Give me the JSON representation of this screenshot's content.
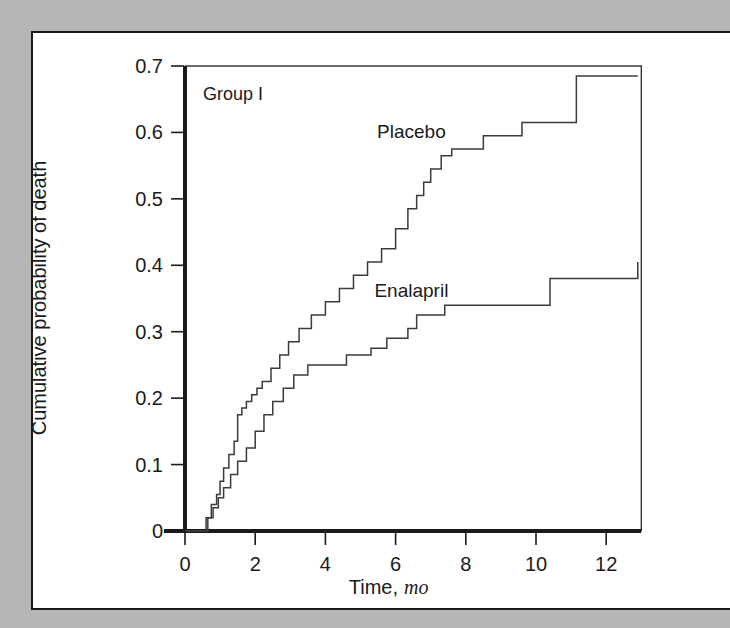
{
  "figure": {
    "background_color": "#b6b6b6",
    "page_color": "#ffffff",
    "border_color": "#1a1a1a",
    "panel_label": "Group I"
  },
  "chart_data": {
    "type": "line",
    "title": "",
    "subtitle": "",
    "annotations": [
      "Group I"
    ],
    "xlabel_text": "Time,",
    "xlabel_emphasis": "mo",
    "xlabel": "Time, mo",
    "ylabel": "Cumulative probability of death",
    "xlim": [
      -0.6,
      13.0
    ],
    "ylim": [
      0,
      0.7
    ],
    "xticks": [
      0,
      2,
      4,
      6,
      8,
      10,
      12
    ],
    "xticklabels": [
      "0",
      "2",
      "4",
      "6",
      "8",
      "10",
      "12"
    ],
    "yticks": [
      0,
      0.1,
      0.2,
      0.3,
      0.4,
      0.5,
      0.6,
      0.7
    ],
    "yticklabels": [
      "0",
      "0.1",
      "0.2",
      "0.3",
      "0.4",
      "0.5",
      "0.6",
      "0.7"
    ],
    "grid": false,
    "legend_position": "inline-annotation",
    "step_style": "post",
    "line_color": "#3b3b3b",
    "series": [
      {
        "name": "Placebo",
        "label_x": 6.45,
        "label_y": 0.592,
        "x": [
          0.0,
          0.35,
          0.6,
          0.75,
          0.9,
          1.0,
          1.1,
          1.25,
          1.4,
          1.5,
          1.62,
          1.75,
          1.9,
          2.05,
          2.2,
          2.45,
          2.7,
          2.95,
          3.25,
          3.6,
          4.0,
          4.4,
          4.8,
          5.2,
          5.6,
          6.0,
          6.35,
          6.6,
          6.8,
          7.0,
          7.3,
          7.6,
          8.5,
          9.6,
          11.15,
          12.9
        ],
        "y": [
          0.0,
          0.0,
          0.02,
          0.04,
          0.055,
          0.075,
          0.095,
          0.115,
          0.135,
          0.175,
          0.185,
          0.195,
          0.205,
          0.215,
          0.225,
          0.245,
          0.265,
          0.285,
          0.305,
          0.325,
          0.345,
          0.365,
          0.385,
          0.405,
          0.425,
          0.455,
          0.485,
          0.505,
          0.525,
          0.545,
          0.565,
          0.575,
          0.595,
          0.615,
          0.685,
          0.685
        ]
      },
      {
        "name": "Enalapril",
        "label_x": 6.45,
        "label_y": 0.352,
        "x": [
          0.0,
          0.45,
          0.65,
          0.8,
          0.95,
          1.1,
          1.3,
          1.5,
          1.75,
          2.0,
          2.25,
          2.5,
          2.8,
          3.1,
          3.5,
          4.05,
          4.6,
          5.3,
          5.75,
          6.1,
          6.35,
          6.6,
          7.4,
          10.1,
          10.4,
          12.9
        ],
        "y": [
          0.0,
          0.0,
          0.02,
          0.035,
          0.05,
          0.065,
          0.085,
          0.105,
          0.125,
          0.15,
          0.175,
          0.195,
          0.215,
          0.235,
          0.25,
          0.25,
          0.265,
          0.275,
          0.29,
          0.29,
          0.305,
          0.325,
          0.34,
          0.34,
          0.38,
          0.405
        ]
      }
    ]
  }
}
